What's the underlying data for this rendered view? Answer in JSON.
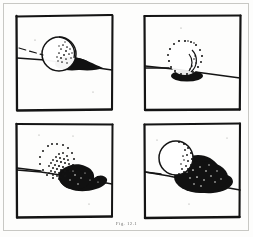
{
  "figure": {
    "caption": "Fig. 12.1",
    "panel_count": 4,
    "background_color": "#fdfdfc",
    "ink_color": "#121212",
    "border_color": "#c8c8c4",
    "media": "hand-drawn ink sketch (scanned)"
  },
  "panels": [
    {
      "id": "panel-top-left",
      "position": "top-left",
      "label": "",
      "frame": {
        "x": 15,
        "y": 14,
        "w": 99,
        "h": 98
      },
      "ground_line": {
        "x1": 0,
        "y1": 44,
        "x2": 99,
        "y2": 56,
        "description": "horizon line sloping down to the right"
      },
      "sphere": {
        "cx": 44,
        "cy": 40,
        "r": 17,
        "outline_style": "solid",
        "stipple_density": "sparse",
        "stipple_side": "right",
        "description": "sphere with solid outline, light stippling on right flank"
      },
      "shadow": {
        "shape": "narrow ellipse",
        "direction": "right",
        "length": 45,
        "description": "long thin black shadow cast to the right along the ground"
      }
    },
    {
      "id": "panel-top-right",
      "position": "top-right",
      "label": "",
      "frame": {
        "x": 143,
        "y": 14,
        "w": 99,
        "h": 98
      },
      "ground_line": {
        "x1": 0,
        "y1": 52,
        "x2": 99,
        "y2": 64,
        "description": "horizon line sloping down to the right"
      },
      "sphere": {
        "cx": 42,
        "cy": 44,
        "r": 17,
        "outline_style": "dotted",
        "stipple_density": "outline-only",
        "stipple_side": "full-ring",
        "description": "sphere drawn as a ring of dots, interior left blank"
      },
      "shadow": {
        "shape": "small squat ellipse",
        "direction": "below",
        "length": 22,
        "description": "short compact black shadow directly beneath the sphere"
      }
    },
    {
      "id": "panel-bottom-left",
      "position": "bottom-left",
      "label": "",
      "frame": {
        "x": 15,
        "y": 122,
        "w": 99,
        "h": 98
      },
      "ground_line": {
        "x1": 0,
        "y1": 48,
        "x2": 99,
        "y2": 62,
        "description": "horizon line sloping down to the right"
      },
      "sphere": {
        "cx": 42,
        "cy": 40,
        "r": 18,
        "outline_style": "dotted",
        "stipple_density": "dense",
        "stipple_side": "lower-right",
        "description": "sphere heavily stippled across the lower-right quadrant"
      },
      "shadow": {
        "shape": "broad teardrop / heart lobe",
        "direction": "right",
        "length": 52,
        "description": "large solid black lobed shadow spreading to the right"
      }
    },
    {
      "id": "panel-bottom-right",
      "position": "bottom-right",
      "label": "",
      "frame": {
        "x": 143,
        "y": 122,
        "w": 99,
        "h": 98
      },
      "ground_line": {
        "x1": 0,
        "y1": 50,
        "x2": 99,
        "y2": 68,
        "description": "horizon line sloping down to the right"
      },
      "sphere": {
        "cx": 33,
        "cy": 36,
        "r": 17,
        "outline_style": "solid-with-dotted-edge",
        "stipple_density": "medium",
        "stipple_side": "right-crescent",
        "description": "sphere with dotted crescent along its right limb"
      },
      "shadow": {
        "shape": "large bulbous mass",
        "direction": "right",
        "length": 58,
        "description": "very large dense black shadow with white speckle texture"
      }
    }
  ]
}
